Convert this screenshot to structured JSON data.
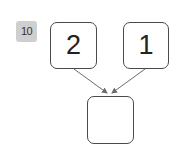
{
  "problem": {
    "number": "10"
  },
  "diagram": {
    "type": "number-bond",
    "top_left": {
      "value": "2"
    },
    "top_right": {
      "value": "1"
    },
    "bottom": {
      "value": ""
    },
    "colors": {
      "box_border": "#4a4a4a",
      "arrow": "#6a6a6a",
      "badge_bg": "#cfcfcf"
    }
  }
}
